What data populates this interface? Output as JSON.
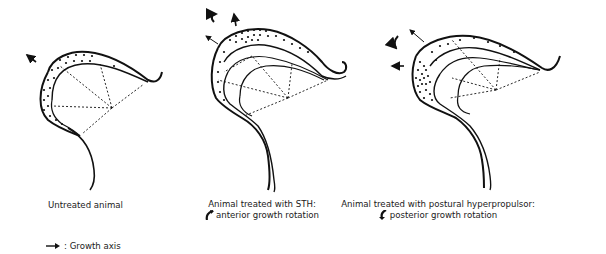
{
  "panels": [
    {
      "id": "untreated",
      "caption_line1": "Untreated animal",
      "caption_line2": ""
    },
    {
      "id": "sth",
      "caption_line1": "Animal treated with STH:",
      "caption_line2": "anterior growth rotation",
      "rotation_icon": "anterior-rotation-arrow-icon"
    },
    {
      "id": "postural-hyperpropulsor",
      "caption_line1": "Animal treated with postural hyperpropulsor:",
      "caption_line2": "posterior growth rotation",
      "rotation_icon": "posterior-rotation-arrow-icon"
    }
  ],
  "legend": {
    "icon": "growth-axis-arrow-icon",
    "label": ": Growth axis"
  },
  "colors": {
    "ink": "#111111",
    "background": "#ffffff"
  }
}
